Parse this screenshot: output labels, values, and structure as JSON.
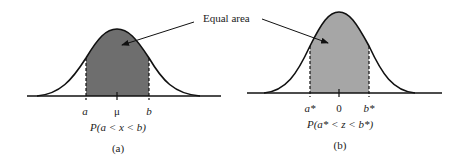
{
  "annotation": {
    "label": "Equal area"
  },
  "panels": [
    {
      "id": "a",
      "caption": "(a)",
      "ticks": [
        "a",
        "μ",
        "b"
      ],
      "probability": "P(a < x < b)",
      "fill_color": "#6e6e6e"
    },
    {
      "id": "b",
      "caption": "(b)",
      "ticks": [
        "a*",
        "0",
        "b*"
      ],
      "probability": "P(a* < z < b*)",
      "fill_color": "#a6a6a6"
    }
  ]
}
